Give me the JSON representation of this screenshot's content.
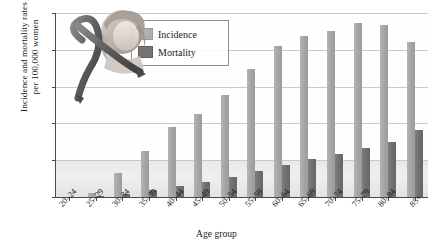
{
  "chart_data": {
    "type": "bar",
    "title": "",
    "xlabel": "Age group",
    "ylabel": "Incidence and mortality rates\nper 100,000 women",
    "ylim": [
      0,
      500
    ],
    "yticks": [
      0,
      100,
      200,
      300,
      400,
      500
    ],
    "grid": true,
    "legend_position": "top-left-inside",
    "categories": [
      "20–24",
      "25–29",
      "30–34",
      "35–39",
      "40–44",
      "45–49",
      "50–54",
      "55–59",
      "60–64",
      "65–69",
      "70–74",
      "75–79",
      "80–84",
      "85+"
    ],
    "series": [
      {
        "name": "Incidence",
        "color": "#a8a8a8",
        "values": [
          1,
          12,
          65,
          125,
          190,
          225,
          277,
          348,
          410,
          438,
          450,
          473,
          468,
          420
        ]
      },
      {
        "name": "Mortality",
        "color": "#707070",
        "values": [
          0,
          2,
          8,
          18,
          30,
          42,
          55,
          72,
          88,
          102,
          118,
          133,
          150,
          182
        ]
      }
    ]
  },
  "legend": {
    "items": [
      {
        "label": "Incidence"
      },
      {
        "label": "Mortality"
      }
    ]
  },
  "artwork": {
    "name": "pink-ribbon-and-woman-illustration"
  },
  "colors": {
    "incidence": "#a8a8a8",
    "mortality": "#707070",
    "axis": "#4a4a4a",
    "grid": "#c9c9c9",
    "band": "#e9e9e9"
  }
}
